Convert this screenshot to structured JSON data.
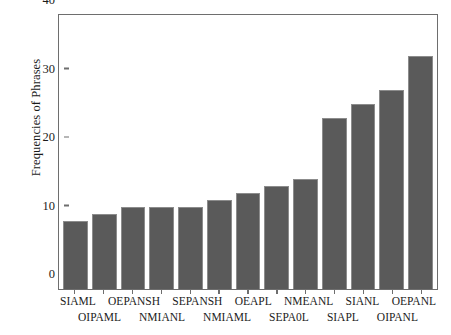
{
  "chart_data": {
    "type": "bar",
    "title": "",
    "xlabel": "",
    "ylabel": "Frequencies of Phrases",
    "ylim": [
      0,
      40
    ],
    "yticks": [
      0,
      10,
      20,
      30,
      40
    ],
    "grid": false,
    "legend": null,
    "bar_color": "#5a5a5a",
    "categories": [
      "SIAML",
      "OIPAML",
      "OEPANSH",
      "NMIANL",
      "SEPANSH",
      "NMIAML",
      "OEAPL",
      "SEPA0L",
      "NMEANL",
      "SIAPL",
      "SIANL",
      "OIPANL",
      "OEPANL"
    ],
    "values": [
      10,
      11,
      12,
      12,
      12,
      13,
      14,
      15,
      16,
      25,
      27,
      29,
      34
    ]
  }
}
